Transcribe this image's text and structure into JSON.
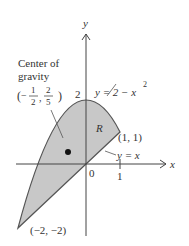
{
  "diagram": {
    "type": "region-between-curves",
    "axes": {
      "x_label": "x",
      "y_label": "y",
      "origin_label": "0",
      "x_tick_label": "1",
      "y_tick_label": "2"
    },
    "curves": [
      {
        "name": "parabola",
        "label_lhs": "y = 2 − x",
        "label_exp": "2",
        "equation": "y = 2 - x^2"
      },
      {
        "name": "line",
        "label": "y = x",
        "equation": "y = x"
      }
    ],
    "region_label": "R",
    "points": [
      {
        "name": "intersection-upper",
        "label": "(1, 1)",
        "x": 1,
        "y": 1
      },
      {
        "name": "intersection-lower",
        "label": "(−2, −2)",
        "x": -2,
        "y": -2
      }
    ],
    "center_of_gravity": {
      "title_line1": "Center of",
      "title_line2": "gravity",
      "x_num": "1",
      "x_den": "2",
      "x_sign": "−",
      "y_num": "2",
      "y_den": "5",
      "x": -0.5,
      "y": 0.4
    },
    "colors": {
      "region_fill": "#c8c8c8",
      "stroke": "#555555",
      "text": "#333333"
    }
  }
}
